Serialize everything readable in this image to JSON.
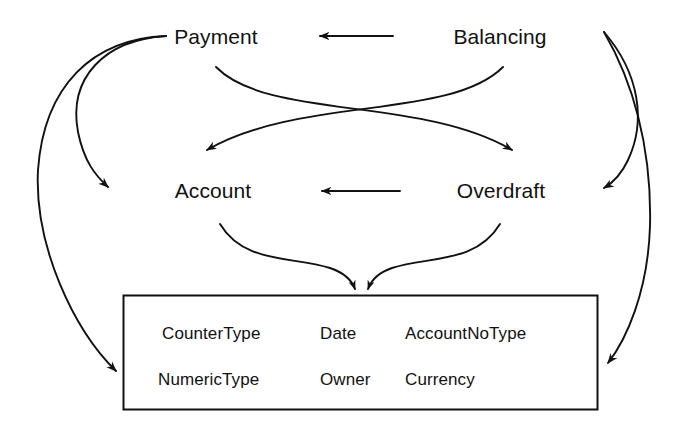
{
  "diagram": {
    "stroke_color": "#111111",
    "background_color": "#ffffff",
    "nodes": [
      {
        "id": "payment",
        "label": "Payment",
        "x": 216,
        "y": 37
      },
      {
        "id": "balancing",
        "label": "Balancing",
        "x": 500,
        "y": 37
      },
      {
        "id": "account",
        "label": "Account",
        "x": 213,
        "y": 191
      },
      {
        "id": "overdraft",
        "label": "Overdraft",
        "x": 501,
        "y": 191
      }
    ],
    "box": {
      "id": "types-box",
      "x": 123,
      "y": 295,
      "width": 475,
      "height": 115,
      "border_color": "#111111",
      "fields": [
        {
          "label": "CounterType",
          "x": 162,
          "y": 334
        },
        {
          "label": "Date",
          "x": 320,
          "y": 334
        },
        {
          "label": "AccountNoType",
          "x": 405,
          "y": 334
        },
        {
          "label": "NumericType",
          "x": 158,
          "y": 380
        },
        {
          "label": "Owner",
          "x": 320,
          "y": 380
        },
        {
          "label": "Currency",
          "x": 405,
          "y": 380
        }
      ]
    },
    "edges": [
      {
        "id": "balancing-to-payment",
        "from": "Balancing",
        "to": "Payment",
        "style": "straight-arrow-left"
      },
      {
        "id": "overdraft-to-account",
        "from": "Overdraft",
        "to": "Account",
        "style": "straight-arrow-left"
      },
      {
        "id": "payment-to-overdraft",
        "from": "Payment",
        "to": "Overdraft",
        "style": "curve-cross-right"
      },
      {
        "id": "balancing-to-account",
        "from": "Balancing",
        "to": "Account",
        "style": "curve-cross-left"
      },
      {
        "id": "payment-to-account",
        "from": "Payment",
        "to": "Account",
        "style": "curve-left-outer"
      },
      {
        "id": "payment-to-types",
        "from": "Payment",
        "to": "types-box",
        "style": "curve-far-left"
      },
      {
        "id": "balancing-to-overdraft",
        "from": "Balancing",
        "to": "Overdraft",
        "style": "curve-right-outer"
      },
      {
        "id": "balancing-to-types",
        "from": "Balancing",
        "to": "types-box",
        "style": "curve-far-right"
      },
      {
        "id": "account-to-types",
        "from": "Account",
        "to": "types-box",
        "style": "curve-converge-left"
      },
      {
        "id": "overdraft-to-types",
        "from": "Overdraft",
        "to": "types-box",
        "style": "curve-converge-right"
      }
    ]
  }
}
